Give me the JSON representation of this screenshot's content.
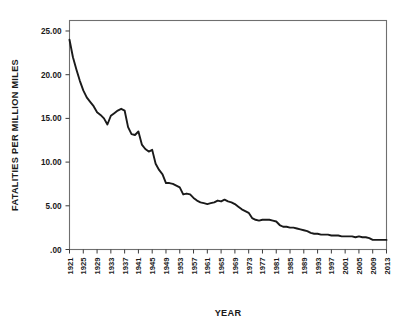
{
  "chart_data": {
    "type": "line",
    "title": "",
    "xlabel": "YEAR",
    "ylabel": "FATALITIES PER MILLION MILES",
    "xlim": [
      1921,
      2013
    ],
    "ylim": [
      0,
      26.2
    ],
    "grid": false,
    "legend": null,
    "ytick_labels": [
      ".00",
      "5.00",
      "10.00",
      "15.00",
      "20.00",
      "25.00"
    ],
    "ytick_values": [
      0,
      5,
      10,
      15,
      20,
      25
    ],
    "xtick_labels": [
      "1921",
      "1925",
      "1929",
      "1933",
      "1937",
      "1941",
      "1945",
      "1949",
      "1953",
      "1957",
      "1961",
      "1965",
      "1969",
      "1973",
      "1977",
      "1981",
      "1985",
      "1989",
      "1993",
      "1997",
      "2001",
      "2005",
      "2009",
      "2013"
    ],
    "xtick_values": [
      1921,
      1925,
      1929,
      1933,
      1937,
      1941,
      1945,
      1949,
      1953,
      1957,
      1961,
      1965,
      1969,
      1973,
      1977,
      1981,
      1985,
      1989,
      1993,
      1997,
      2001,
      2005,
      2009,
      2013
    ],
    "series": [
      {
        "name": "Fatality rate",
        "x": [
          1921,
          1922,
          1923,
          1924,
          1925,
          1926,
          1927,
          1928,
          1929,
          1930,
          1931,
          1932,
          1933,
          1934,
          1935,
          1936,
          1937,
          1938,
          1939,
          1940,
          1941,
          1942,
          1943,
          1944,
          1945,
          1946,
          1947,
          1948,
          1949,
          1950,
          1951,
          1952,
          1953,
          1954,
          1955,
          1956,
          1957,
          1958,
          1959,
          1960,
          1961,
          1962,
          1963,
          1964,
          1965,
          1966,
          1967,
          1968,
          1969,
          1970,
          1971,
          1972,
          1973,
          1974,
          1975,
          1976,
          1977,
          1978,
          1979,
          1980,
          1981,
          1982,
          1983,
          1984,
          1985,
          1986,
          1987,
          1988,
          1989,
          1990,
          1991,
          1992,
          1993,
          1994,
          1995,
          1996,
          1997,
          1998,
          1999,
          2000,
          2001,
          2002,
          2003,
          2004,
          2005,
          2006,
          2007,
          2008,
          2009,
          2010,
          2011,
          2012,
          2013
        ],
        "y": [
          24.0,
          22.0,
          20.6,
          19.3,
          18.2,
          17.4,
          16.9,
          16.4,
          15.7,
          15.4,
          15.0,
          14.3,
          15.3,
          15.6,
          15.9,
          16.1,
          15.9,
          14.0,
          13.2,
          13.1,
          13.5,
          12.0,
          11.5,
          11.2,
          11.4,
          9.8,
          9.1,
          8.6,
          7.6,
          7.6,
          7.5,
          7.3,
          7.1,
          6.3,
          6.4,
          6.3,
          5.9,
          5.6,
          5.4,
          5.3,
          5.2,
          5.3,
          5.4,
          5.6,
          5.5,
          5.7,
          5.5,
          5.4,
          5.2,
          4.9,
          4.6,
          4.4,
          4.2,
          3.6,
          3.4,
          3.3,
          3.4,
          3.4,
          3.4,
          3.3,
          3.2,
          2.8,
          2.6,
          2.6,
          2.5,
          2.5,
          2.4,
          2.3,
          2.2,
          2.1,
          1.9,
          1.8,
          1.8,
          1.7,
          1.7,
          1.7,
          1.6,
          1.6,
          1.6,
          1.5,
          1.5,
          1.5,
          1.5,
          1.4,
          1.5,
          1.4,
          1.4,
          1.3,
          1.1,
          1.1,
          1.1,
          1.1,
          1.1
        ]
      }
    ]
  }
}
